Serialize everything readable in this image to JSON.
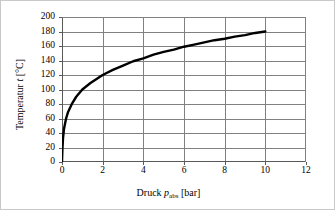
{
  "chart_data": {
    "type": "line",
    "title": "",
    "xlabel": "Druck p_abs [bar]",
    "ylabel": "Temperatur t [°C]",
    "xlim": [
      0,
      12
    ],
    "ylim": [
      0,
      200
    ],
    "xticks": [
      0,
      2,
      4,
      6,
      8,
      10,
      12
    ],
    "yticks": [
      0,
      20,
      40,
      60,
      80,
      100,
      120,
      140,
      160,
      180,
      200
    ],
    "grid": true,
    "legend": "none",
    "series": [
      {
        "name": "Siedetemperatur Wasser",
        "x": [
          0.0,
          0.02,
          0.05,
          0.1,
          0.2,
          0.3,
          0.5,
          0.7,
          1.0,
          1.4,
          2.0,
          2.5,
          3.0,
          3.5,
          4.0,
          4.5,
          5.0,
          5.5,
          6.0,
          6.5,
          7.0,
          7.5,
          8.0,
          8.5,
          9.0,
          9.5,
          10.0
        ],
        "values": [
          0,
          18,
          33,
          46,
          60,
          69,
          81,
          90,
          100,
          109,
          120,
          127,
          133,
          139,
          143,
          148,
          152,
          155,
          159,
          162,
          165,
          168,
          170,
          173,
          175,
          178,
          180
        ]
      }
    ]
  },
  "axes": {
    "y_title_prefix": "Temperatur ",
    "y_title_symbol": "t",
    "y_title_suffix": " [°C]",
    "x_title_prefix": "Druck ",
    "x_title_symbol": "p",
    "x_title_subscript": "abs",
    "x_title_suffix": " [bar]",
    "y_tick_labels": [
      "200",
      "180",
      "160",
      "140",
      "120",
      "100",
      "80",
      "60",
      "40",
      "20",
      "0"
    ],
    "x_tick_labels": [
      "0",
      "2",
      "4",
      "6",
      "8",
      "10",
      "12"
    ]
  },
  "colors": {
    "curve": "#000000",
    "grid": "#808080",
    "axis": "#595959",
    "frame": "#c9c9c9",
    "background": "#ffffff"
  }
}
